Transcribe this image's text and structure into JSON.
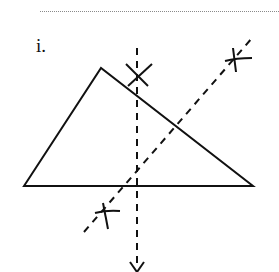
{
  "diagram": {
    "part_label": "i.",
    "colors": {
      "ink": "#111111",
      "rule": "#8a8a8a",
      "background": "#ffffff"
    },
    "triangle": {
      "vertices": [
        [
          24,
          186
        ],
        [
          101,
          68
        ],
        [
          253,
          186
        ]
      ],
      "description": "scalene triangle with horizontal base"
    },
    "constructions": [
      {
        "type": "perpendicular-bisector",
        "name": "vertical dashed line",
        "from": [
          137,
          48
        ],
        "to": [
          137,
          268
        ],
        "style": "dashed"
      },
      {
        "type": "perpendicular-bisector",
        "name": "diagonal dashed line",
        "from": [
          84,
          232
        ],
        "to": [
          252,
          38
        ],
        "style": "dashed"
      }
    ],
    "arc_marks": [
      {
        "name": "top vertical arc cross",
        "at": [
          137,
          76
        ]
      },
      {
        "name": "bottom vertical arc cross",
        "at": [
          137,
          268
        ]
      },
      {
        "name": "upper diagonal arc cross",
        "at": [
          235,
          58
        ]
      },
      {
        "name": "lower diagonal arc cross",
        "at": [
          105,
          212
        ]
      }
    ]
  }
}
